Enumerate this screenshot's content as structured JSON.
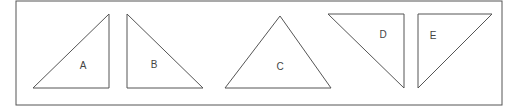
{
  "diagram": {
    "frame": {
      "x": 16,
      "y": 1,
      "w": 486,
      "h": 104,
      "stroke": "#555555"
    },
    "triangles": [
      {
        "label": "A",
        "points": "33,88 109,14 109,88",
        "label_x": 83,
        "label_y": 69
      },
      {
        "label": "B",
        "points": "127,14 127,88 203,88",
        "label_x": 154,
        "label_y": 68
      },
      {
        "label": "C",
        "points": "280,16 225,88 331,88",
        "label_x": 280,
        "label_y": 70
      },
      {
        "label": "D",
        "points": "328,14 404,14 404,88",
        "label_x": 383,
        "label_y": 38
      },
      {
        "label": "E",
        "points": "418,14 492,14 418,88",
        "label_x": 433,
        "label_y": 39
      }
    ]
  }
}
